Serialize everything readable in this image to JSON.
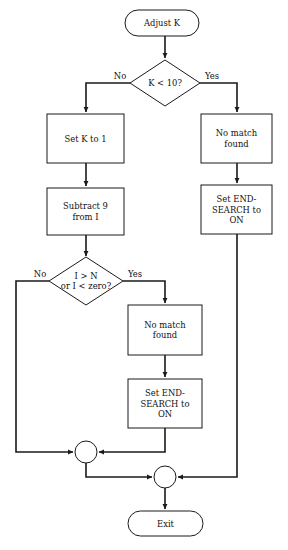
{
  "diagram": {
    "type": "flowchart",
    "canvas": {
      "width": 288,
      "height": 550
    },
    "colors": {
      "background": "#ffffff",
      "stroke": "#1a1a1a",
      "text": "#111111",
      "fill": "#ffffff"
    },
    "nodes": [
      {
        "id": "start",
        "shape": "terminator",
        "label": "Adjust K",
        "lines": [
          "Adjust K"
        ],
        "x": 125,
        "y": 10,
        "w": 74,
        "h": 26
      },
      {
        "id": "decision_k",
        "shape": "diamond",
        "label": "K < 10?",
        "lines": [
          "K < 10?"
        ],
        "cx": 165,
        "cy": 83,
        "rx": 35,
        "ry": 23
      },
      {
        "id": "set_k_to_1",
        "shape": "rectangle",
        "label": "Set K to 1",
        "lines": [
          "Set K to 1"
        ],
        "x": 47,
        "y": 114,
        "w": 77,
        "h": 49
      },
      {
        "id": "no_match_found_1",
        "shape": "rectangle",
        "label": "No match found",
        "lines": [
          "No match",
          "found"
        ],
        "x": 201,
        "y": 114,
        "w": 71,
        "h": 49
      },
      {
        "id": "subtract_9_from_i",
        "shape": "rectangle",
        "label": "Subtract 9 from I",
        "lines": [
          "Subtract 9",
          "from I"
        ],
        "x": 47,
        "y": 188,
        "w": 77,
        "h": 47
      },
      {
        "id": "set_end_search_on_1",
        "shape": "rectangle",
        "label": "Set END-SEARCH to ON",
        "lines": [
          "Set END-",
          "SEARCH to",
          "ON"
        ],
        "x": 201,
        "y": 185,
        "w": 71,
        "h": 49
      },
      {
        "id": "decision_i",
        "shape": "diamond",
        "label": "I > N or I < zero?",
        "lines": [
          "I > N",
          "or I < zero?"
        ],
        "cx": 86,
        "cy": 281,
        "rx": 37,
        "ry": 24
      },
      {
        "id": "no_match_found_2",
        "shape": "rectangle",
        "label": "No match found",
        "lines": [
          "No match",
          "found"
        ],
        "x": 128,
        "y": 305,
        "w": 74,
        "h": 50
      },
      {
        "id": "set_end_search_on_2",
        "shape": "rectangle",
        "label": "Set END-SEARCH to ON",
        "lines": [
          "Set END-",
          "SEARCH to",
          "ON"
        ],
        "x": 128,
        "y": 379,
        "w": 74,
        "h": 49
      },
      {
        "id": "connector_1",
        "shape": "circle",
        "label": "",
        "lines": [],
        "cx": 86,
        "cy": 452,
        "r": 11
      },
      {
        "id": "connector_2",
        "shape": "circle",
        "label": "",
        "lines": [],
        "cx": 165,
        "cy": 477,
        "r": 11
      },
      {
        "id": "exit",
        "shape": "terminator",
        "label": "Exit",
        "lines": [
          "Exit"
        ],
        "x": 128,
        "y": 511,
        "w": 75,
        "h": 25
      }
    ],
    "edge_labels": [
      {
        "id": "label_no_k",
        "text": "No",
        "x": 120,
        "y": 76
      },
      {
        "id": "label_yes_k",
        "text": "Yes",
        "x": 212,
        "y": 76
      },
      {
        "id": "label_no_i",
        "text": "No",
        "x": 40,
        "y": 274
      },
      {
        "id": "label_yes_i",
        "text": "Yes",
        "x": 135,
        "y": 274
      }
    ],
    "edges": [
      {
        "id": "edge-start-to-decision-k",
        "from": "start",
        "to": "decision_k",
        "points": "165,36 165,58",
        "arrow": true
      },
      {
        "id": "edge-decision-k-no",
        "from": "decision_k",
        "to": "set_k_to_1",
        "points": "130,83 86,83 86,112",
        "arrow": true
      },
      {
        "id": "edge-decision-k-yes",
        "from": "decision_k",
        "to": "no_match_found_1",
        "points": "200,83 237,83 237,112",
        "arrow": true
      },
      {
        "id": "edge-set-k-to-subtract",
        "from": "set_k_to_1",
        "to": "subtract_9_from_i",
        "points": "86,163 86,186",
        "arrow": true
      },
      {
        "id": "edge-nomatch1-to-endsearch1",
        "from": "no_match_found_1",
        "to": "set_end_search_on_1",
        "points": "237,163 237,183",
        "arrow": true
      },
      {
        "id": "edge-subtract-to-decision-i",
        "from": "subtract_9_from_i",
        "to": "decision_i",
        "points": "86,235 86,256",
        "arrow": true
      },
      {
        "id": "edge-decision-i-yes",
        "from": "decision_i",
        "to": "no_match_found_2",
        "points": "123,281 165,281 165,303",
        "arrow": true
      },
      {
        "id": "edge-nomatch2-to-endsearch2",
        "from": "no_match_found_2",
        "to": "set_end_search_on_2",
        "points": "165,355 165,377",
        "arrow": true
      },
      {
        "id": "edge-decision-i-no",
        "from": "decision_i",
        "to": "connector_1",
        "points": "49,281 16,281 16,452 73,452",
        "arrow": true
      },
      {
        "id": "edge-endsearch2-to-connector1",
        "from": "set_end_search_on_2",
        "to": "connector_1",
        "points": "165,428 165,452 99,452",
        "arrow": true
      },
      {
        "id": "edge-connector1-to-connector2",
        "from": "connector_1",
        "to": "connector_2",
        "points": "86,463 86,477 152,477",
        "arrow": true
      },
      {
        "id": "edge-endsearch1-to-connector2",
        "from": "set_end_search_on_1",
        "to": "connector_2",
        "points": "237,234 237,477 178,477",
        "arrow": true
      },
      {
        "id": "edge-connector2-to-exit",
        "from": "connector_2",
        "to": "exit",
        "points": "165,488 165,509",
        "arrow": true
      }
    ]
  }
}
